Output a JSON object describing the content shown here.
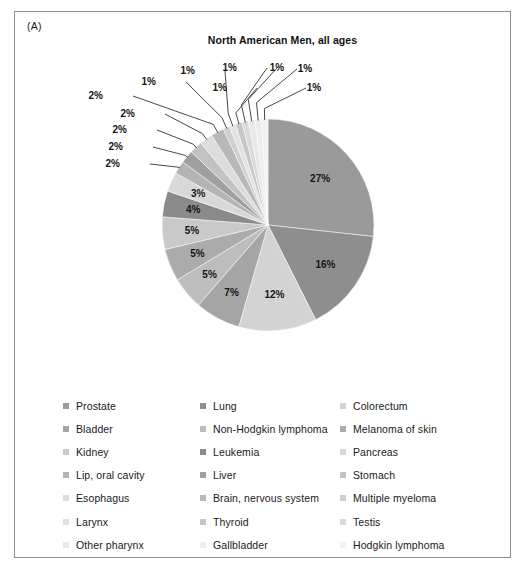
{
  "panel": {
    "label": "(A)"
  },
  "chart_title": "North American Men, all ages",
  "chart_data": {
    "type": "pie",
    "title": "North American Men, all ages",
    "xlabel": "",
    "ylabel": "",
    "legend_position": "bottom",
    "grid": false,
    "start_angle_deg": 0,
    "direction": "clockwise",
    "unit": "%",
    "categories": [
      "Prostate",
      "Lung",
      "Colorectum",
      "Bladder",
      "Non-Hodgkin lymphoma",
      "Melanoma of skin",
      "Kidney",
      "Leukemia",
      "Pancreas",
      "Lip, oral cavity",
      "Liver",
      "Stomach",
      "Esophagus",
      "Brain, nervous system",
      "Multiple myeloma",
      "Larynx",
      "Thyroid",
      "Testis",
      "Other pharynx",
      "Gallbladder",
      "Hodgkin lymphoma"
    ],
    "values": [
      27,
      16,
      12,
      7,
      5,
      5,
      5,
      4,
      3,
      2,
      2,
      2,
      2,
      2,
      1,
      1,
      1,
      1,
      1,
      1,
      1
    ],
    "labels": [
      "27%",
      "16%",
      "12%",
      "7%",
      "5%",
      "5%",
      "5%",
      "4%",
      "3%",
      "2%",
      "2%",
      "2%",
      "2%",
      "2%",
      "1%",
      "1%",
      "1%",
      "1%",
      "1%",
      "1%",
      "1%"
    ],
    "colors": [
      "#9a9a9a",
      "#8e8e8e",
      "#d3d3d3",
      "#a5a5a5",
      "#bdbdbd",
      "#ababab",
      "#c9c9c9",
      "#8a8a8a",
      "#d8d8d8",
      "#b4b4b4",
      "#a0a0a0",
      "#c2c2c2",
      "#dcdcdc",
      "#b8b8b8",
      "#cfcfcf",
      "#e2e2e2",
      "#c6c6c6",
      "#dadada",
      "#e8e8e8",
      "#ededed",
      "#f2f2f2"
    ]
  },
  "legend": {
    "rows": [
      [
        {
          "label": "Prostate",
          "color": "#9a9a9a"
        },
        {
          "label": "Lung",
          "color": "#8e8e8e"
        },
        {
          "label": "Colorectum",
          "color": "#d3d3d3"
        }
      ],
      [
        {
          "label": "Bladder",
          "color": "#a5a5a5"
        },
        {
          "label": "Non-Hodgkin lymphoma",
          "color": "#bdbdbd"
        },
        {
          "label": "Melanoma of skin",
          "color": "#ababab"
        }
      ],
      [
        {
          "label": "Kidney",
          "color": "#c9c9c9"
        },
        {
          "label": "Leukemia",
          "color": "#8a8a8a"
        },
        {
          "label": "Pancreas",
          "color": "#d8d8d8"
        }
      ],
      [
        {
          "label": "Lip, oral cavity",
          "color": "#b4b4b4"
        },
        {
          "label": "Liver",
          "color": "#a0a0a0"
        },
        {
          "label": "Stomach",
          "color": "#c2c2c2"
        }
      ],
      [
        {
          "label": "Esophagus",
          "color": "#dcdcdc"
        },
        {
          "label": "Brain, nervous system",
          "color": "#b8b8b8"
        },
        {
          "label": "Multiple myeloma",
          "color": "#cfcfcf"
        }
      ],
      [
        {
          "label": "Larynx",
          "color": "#e2e2e2"
        },
        {
          "label": "Thyroid",
          "color": "#c6c6c6"
        },
        {
          "label": "Testis",
          "color": "#dadada"
        }
      ],
      [
        {
          "label": "Other pharynx",
          "color": "#e8e8e8"
        },
        {
          "label": "Gallbladder",
          "color": "#ededed"
        },
        {
          "label": "Hodgkin lymphoma",
          "color": "#f2f2f2"
        }
      ]
    ]
  }
}
